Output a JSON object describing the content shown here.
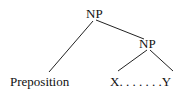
{
  "tree": {
    "root": {
      "label": "NP"
    },
    "child_np": {
      "label": "NP"
    },
    "left_leaf": {
      "label": "Preposition"
    },
    "xy_leaf": {
      "label": "X. . . . . . .Y"
    }
  }
}
